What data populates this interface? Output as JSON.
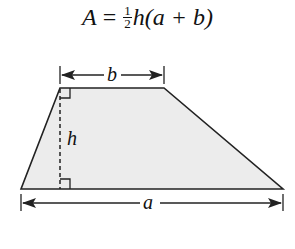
{
  "formula": {
    "lhs": "A",
    "eq": " = ",
    "frac_num": "1",
    "frac_den": "2",
    "rest_h": "h",
    "rest_paren": "(a + b)"
  },
  "diagram": {
    "shape": "trapezoid",
    "fill_color": "#ececec",
    "stroke_color": "#222222",
    "labels": {
      "top_base": "b",
      "bottom_base": "a",
      "height": "h"
    }
  }
}
